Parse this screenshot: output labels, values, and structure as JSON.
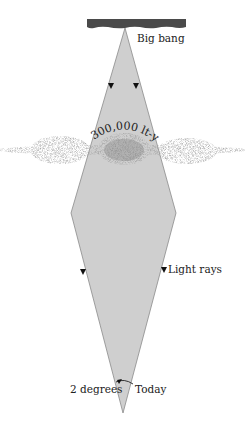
{
  "diagram": {
    "labels": {
      "top": "Big bang",
      "distance": "300,000 lt-yr",
      "rays": "Light rays",
      "angle": "2 degrees",
      "bottom": "Today"
    },
    "colors": {
      "cone_fill": "#cfcfcf",
      "cone_stroke": "#8a8a8a",
      "bar": "#4a4a4a",
      "galaxy": "#7a7a7a",
      "text": "#222222"
    },
    "geometry": {
      "top_apex": [
        125,
        28
      ],
      "left_vertex": [
        71,
        213
      ],
      "right_vertex": [
        176,
        213
      ],
      "bottom_apex": [
        123,
        413
      ],
      "bar": {
        "x": 87,
        "y": 19,
        "w": 99,
        "h": 9
      }
    }
  }
}
